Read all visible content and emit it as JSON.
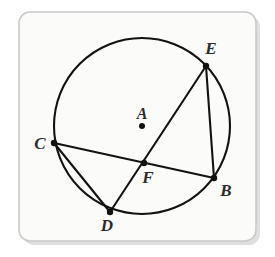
{
  "figure": {
    "kind": "circle-geometry-diagram",
    "canvas": {
      "width": 275,
      "height": 257,
      "background": "#ffffff"
    },
    "card": {
      "x": 19,
      "y": 12,
      "width": 237,
      "height": 229,
      "corner_radius": 11,
      "fill": "#fbfbfa",
      "border_color": "#c9c9c9",
      "shadow_color": "#c4c4c4"
    },
    "circle": {
      "center_label": "A",
      "center_x": 142,
      "center_y": 126,
      "radius": 88,
      "stroke_color": "#121212",
      "stroke_width": 2.1
    },
    "center_point": {
      "label": "A",
      "x": 142,
      "y": 126,
      "label_x": 142,
      "label_y": 119,
      "dot_radius": 3.0
    },
    "points": [
      {
        "label": "B",
        "x": 214,
        "y": 178,
        "label_x": 226,
        "label_y": 196,
        "dot_radius": 3.2
      },
      {
        "label": "C",
        "x": 54,
        "y": 143,
        "label_x": 40,
        "label_y": 149,
        "dot_radius": 3.2
      },
      {
        "label": "D",
        "x": 110,
        "y": 212,
        "label_x": 107,
        "label_y": 231,
        "dot_radius": 3.2
      },
      {
        "label": "E",
        "x": 206,
        "y": 66,
        "label_x": 211,
        "label_y": 54,
        "dot_radius": 3.2
      },
      {
        "label": "F",
        "x": 144,
        "y": 163,
        "label_x": 148,
        "label_y": 183,
        "dot_radius": 3.2
      }
    ],
    "chords": [
      {
        "name": "chord-c-b",
        "from": "C",
        "x1": 54,
        "y1": 143,
        "to": "B",
        "x2": 214,
        "y2": 178
      },
      {
        "name": "chord-e-d",
        "from": "E",
        "x1": 206,
        "y1": 66,
        "to": "D",
        "x2": 110,
        "y2": 212
      },
      {
        "name": "chord-e-b",
        "from": "E",
        "x1": 206,
        "y1": 66,
        "to": "B",
        "x2": 214,
        "y2": 178
      },
      {
        "name": "chord-c-d",
        "from": "C",
        "x1": 54,
        "y1": 143,
        "to": "D",
        "x2": 110,
        "y2": 212
      }
    ],
    "intersection": {
      "label": "F",
      "x": 144,
      "y": 163
    }
  }
}
